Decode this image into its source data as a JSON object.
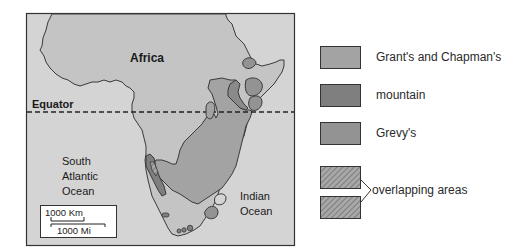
{
  "map": {
    "labels": {
      "continent": "Africa",
      "equator": "Equator",
      "atlantic_line1": "South",
      "atlantic_line2": "Atlantic",
      "atlantic_line3": "Ocean",
      "indian_line1": "Indian",
      "indian_line2": "Ocean"
    },
    "scale_bar": {
      "km_label": "1000 Km",
      "mi_label": "1000 Mi"
    },
    "colors": {
      "ocean": "#d2d2d2",
      "land": "#c4c4c4",
      "grants_chapman": "#a3a3a3",
      "mountain": "#7f7f7f",
      "grevys": "#939393",
      "border": "#3a3a3a"
    }
  },
  "legend": {
    "items": [
      {
        "label": "Grant's and Chapman's",
        "pattern": "solid",
        "color": "#a3a3a3"
      },
      {
        "label": "mountain",
        "pattern": "solid",
        "color": "#7f7f7f"
      },
      {
        "label": "Grevy's",
        "pattern": "solid",
        "color": "#939393"
      },
      {
        "label": "overlapping areas",
        "pattern": "hatched",
        "color": "#9a9a9a"
      }
    ]
  }
}
